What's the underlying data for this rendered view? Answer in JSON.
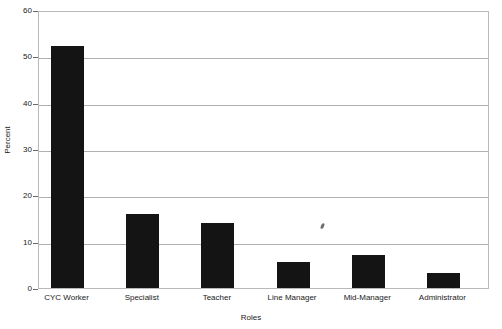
{
  "chart_data": {
    "type": "bar",
    "title": "",
    "xlabel": "Roles",
    "ylabel": "Percent",
    "categories": [
      "CYC Worker",
      "Specialist",
      "Teacher",
      "Line Manager",
      "Mid-Manager",
      "Administrator"
    ],
    "values": [
      52.3,
      16.0,
      14.0,
      5.6,
      7.1,
      3.2
    ],
    "ylim": [
      0,
      60
    ],
    "yticks": [
      0,
      10,
      20,
      30,
      40,
      50,
      60
    ],
    "ytick_labels": [
      "0",
      "10",
      "20",
      "30",
      "40",
      "50",
      "60"
    ],
    "grid": true,
    "grid_axis": "y",
    "legend": false,
    "bar_color": "#141414",
    "frame_color": "#b9b9b9",
    "gridline_color": "#b0b0b0",
    "background": "#ffffff"
  },
  "artifacts": {
    "speck_label": "scan-speck"
  }
}
